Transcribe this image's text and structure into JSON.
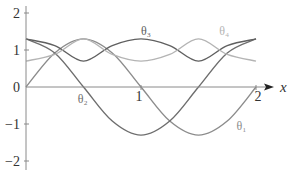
{
  "chart_data": {
    "type": "line",
    "title": "",
    "xlabel": "x",
    "ylabel": "",
    "xlim": [
      0,
      2
    ],
    "ylim": [
      -2,
      2
    ],
    "grid": false,
    "legend": "inline curve labels",
    "x_ticks": [
      "1",
      "2"
    ],
    "y_ticks": [
      "2",
      "1",
      "0",
      "−1",
      "−2"
    ],
    "x": [
      0,
      0.25,
      0.5,
      0.75,
      1.0,
      1.25,
      1.5,
      1.75,
      2.0
    ],
    "series": [
      {
        "name": "θ₁",
        "color": "#8c8c8c",
        "values": [
          0,
          0.92,
          1.3,
          0.92,
          0,
          -0.92,
          -1.3,
          -0.92,
          0
        ]
      },
      {
        "name": "θ₂",
        "color": "#6e6e6e",
        "values": [
          1.3,
          0.92,
          0,
          -0.92,
          -1.3,
          -0.92,
          0,
          0.92,
          1.3
        ]
      },
      {
        "name": "θ₃",
        "color": "#606060",
        "values": [
          1.3,
          1.12,
          0.7,
          1.12,
          1.3,
          1.12,
          0.7,
          1.12,
          1.3
        ]
      },
      {
        "name": "θ₄",
        "color": "#b4b4b4",
        "values": [
          0.7,
          0.88,
          1.3,
          0.88,
          0.7,
          0.88,
          1.3,
          0.88,
          0.7
        ]
      }
    ],
    "annotations": [
      {
        "text": "θ₁",
        "x": 1.83,
        "y": -1.15
      },
      {
        "text": "θ₂",
        "x": 0.45,
        "y": -0.42
      },
      {
        "text": "θ₃",
        "x": 1.0,
        "y": 1.4
      },
      {
        "text": "θ₄",
        "x": 1.68,
        "y": 1.4
      }
    ]
  }
}
